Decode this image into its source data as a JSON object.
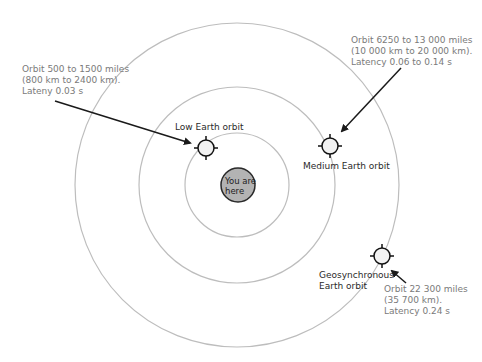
{
  "earth": {
    "line1": "You are",
    "line2": "here",
    "fill": "#b3b3b3"
  },
  "orbits": {
    "low": {
      "name": "Low Earth orbit",
      "info": [
        "Orbit 500 to 1500 miles",
        "(800 km to 2400 km).",
        "Lateny 0.03 s"
      ]
    },
    "medium": {
      "name": "Medium Earth orbit",
      "info": [
        "Orbit 6250 to 13 000 miles",
        "(10 000 km to 20 000 km).",
        "Latency 0.06 to 0.14 s"
      ]
    },
    "geo": {
      "name_line1": "Geosynchronous",
      "name_line2": "Earth orbit",
      "info": [
        "Orbit 22 300 miles",
        "(35 700 km).",
        "Latency 0.24 s"
      ]
    }
  },
  "colors": {
    "orbit_ring": "#bdbdbd",
    "arrow": "#1a1a1a",
    "info_text": "#7a7a7a",
    "satellite_fill": "#f2f2f2"
  }
}
